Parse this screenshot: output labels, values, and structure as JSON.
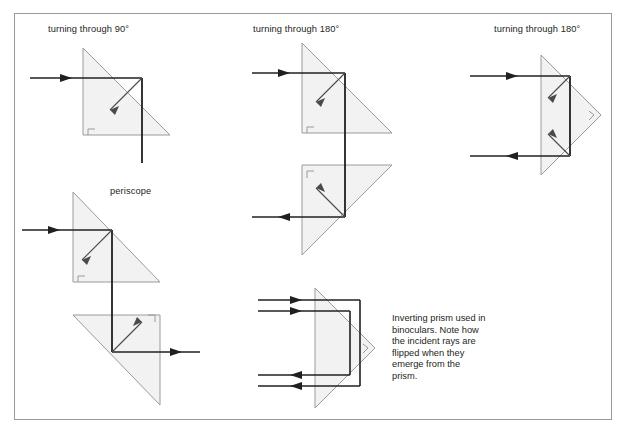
{
  "figure": {
    "border_color": "#9a9a9a",
    "background": "#ffffff",
    "width": 629,
    "height": 435
  },
  "style": {
    "prism_fill": "#f2f2f2",
    "prism_stroke": "#9a9a9a",
    "ray_color": "#231f20",
    "normal_color": "#333333",
    "text_color": "#231f20"
  },
  "labels": {
    "turning_90": "turning through 90°",
    "periscope": "periscope",
    "turning_180_middle": "turning through 180°",
    "turning_180_right": "turning through 180°"
  },
  "caption": {
    "binocular_note": "Inverting prism used in binoculars. Note how the incident rays are flipped when they emerge from the prism."
  },
  "diagrams": [
    {
      "name": "turning-through-90",
      "label": "turning through 90°",
      "prisms": [
        {
          "name": "prism-90-main",
          "shape": "right-triangle",
          "points": "83,48 83,135 170,135",
          "right_angle_corner": "83,135"
        }
      ],
      "rays": [
        {
          "name": "incident-ray",
          "from": "30,78",
          "to": "142,78",
          "direction": "right",
          "arrow": true
        },
        {
          "name": "reflected-ray",
          "from": "142,78",
          "to": "142,163",
          "direction": "down",
          "arrow": false
        }
      ],
      "normals": [
        {
          "name": "normal-line",
          "from": "142,78",
          "to": "110,110"
        }
      ]
    },
    {
      "name": "periscope",
      "label": "periscope",
      "prisms": [
        {
          "name": "prism-periscope-upper",
          "shape": "right-triangle",
          "points": "73,192 73,282 160,282",
          "right_angle_corner": "73,282"
        },
        {
          "name": "prism-periscope-lower",
          "shape": "right-triangle",
          "points": "73,315 160,315 160,405",
          "right_angle_corner": "160,315"
        }
      ],
      "rays": [
        {
          "name": "incident-ray",
          "from": "22,230",
          "to": "112,230",
          "direction": "right",
          "arrow": true
        },
        {
          "name": "internal-ray",
          "from": "112,230",
          "to": "112,352",
          "direction": "down",
          "arrow": false
        },
        {
          "name": "emergent-ray",
          "from": "112,352",
          "to": "200,352",
          "direction": "right",
          "arrow": true
        }
      ],
      "normals": [
        {
          "name": "normal-upper",
          "from": "112,230",
          "to": "82,260"
        },
        {
          "name": "normal-lower",
          "from": "112,352",
          "to": "142,322"
        }
      ]
    },
    {
      "name": "turning-through-180-middle",
      "label": "turning through 180°",
      "prisms": [
        {
          "name": "prism-180-upper",
          "shape": "right-triangle",
          "points": "302,43 302,133 392,133",
          "right_angle_corner": "302,133"
        },
        {
          "name": "prism-180-lower",
          "shape": "right-triangle",
          "points": "302,165 392,165 302,255",
          "right_angle_corner": "302,165"
        }
      ],
      "rays": [
        {
          "name": "incident-ray",
          "from": "252,73",
          "to": "345,73",
          "direction": "right",
          "arrow": true
        },
        {
          "name": "internal-ray",
          "from": "345,73",
          "to": "345,217",
          "direction": "down",
          "arrow": false
        },
        {
          "name": "emergent-ray",
          "from": "345,217",
          "to": "252,217",
          "direction": "left",
          "arrow": true
        }
      ],
      "normals": [
        {
          "name": "normal-upper",
          "from": "345,73",
          "to": "318,100"
        },
        {
          "name": "normal-lower",
          "from": "345,217",
          "to": "318,190"
        }
      ]
    },
    {
      "name": "turning-through-180-right",
      "label": "turning through 180°",
      "prisms": [
        {
          "name": "prism-180-right",
          "shape": "right-triangle",
          "points": "541,55 541,175 601,115",
          "right_angle_corner": "601,115"
        }
      ],
      "rays": [
        {
          "name": "incident-ray",
          "from": "470,76",
          "to": "570,76",
          "direction": "right",
          "arrow": true
        },
        {
          "name": "internal-ray",
          "from": "570,76",
          "to": "570,156",
          "direction": "down",
          "arrow": false
        },
        {
          "name": "emergent-ray",
          "from": "570,156",
          "to": "470,156",
          "direction": "left",
          "arrow": true
        }
      ],
      "normals": [
        {
          "name": "normal-upper",
          "from": "570,76",
          "to": "548,98"
        },
        {
          "name": "normal-lower",
          "from": "570,156",
          "to": "548,134"
        }
      ]
    },
    {
      "name": "inverting-prism-binoculars",
      "label": "Inverting prism used in binoculars. Note how the incident rays are flipped when they emerge from the prism.",
      "prisms": [
        {
          "name": "prism-inverting",
          "shape": "right-triangle",
          "points": "315,288 315,408 375,348",
          "right_angle_corner": "375,348"
        }
      ],
      "rays": [
        {
          "name": "incident-ray-1",
          "from": "258,300",
          "to": "360,300",
          "direction": "right",
          "arrow": true
        },
        {
          "name": "incident-ray-2",
          "from": "258,310",
          "to": "350,310",
          "direction": "right",
          "arrow": true
        },
        {
          "name": "internal-ray-1",
          "from": "360,300",
          "to": "360,386",
          "direction": "down",
          "arrow": false
        },
        {
          "name": "internal-ray-2",
          "from": "350,310",
          "to": "350,376",
          "direction": "down",
          "arrow": false
        },
        {
          "name": "emergent-ray-1",
          "from": "360,386",
          "to": "258,386",
          "direction": "left",
          "arrow": true
        },
        {
          "name": "emergent-ray-2",
          "from": "350,376",
          "to": "258,376",
          "direction": "left",
          "arrow": true
        }
      ]
    }
  ]
}
